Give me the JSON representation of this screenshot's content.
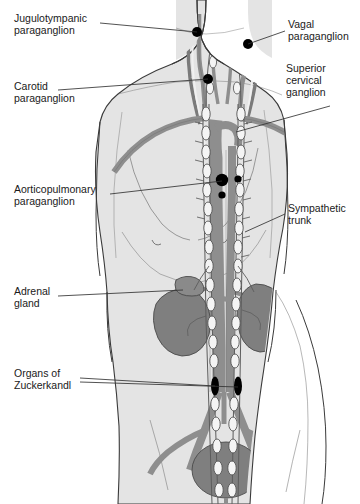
{
  "figure": {
    "background_color": "#ffffff"
  },
  "palette": {
    "body_fill": "#e4e4e4",
    "body_outline": "#3a3a3a",
    "skin_shadow": "#d2d2d2",
    "vessel_fill": "#8e8e8e",
    "vessel_outline": "#4a4a4a",
    "nerve_fill": "#f2f2f2",
    "nerve_outline": "#555555",
    "organ_fill": "#7f7f7f",
    "organ_outline": "#4a4a4a",
    "paraganglion_fill": "#000000",
    "leader_line": "#333333",
    "text": "#1a1a1a"
  },
  "labels": [
    {
      "id": "jugulotympanic-paraganglion",
      "lines": [
        "Jugulotympanic",
        "paraganglion"
      ],
      "text": "Jugulotympanic paraganglion",
      "x": 14,
      "y": 18,
      "align": "left",
      "leader": {
        "x1": 100,
        "y1": 23,
        "x2": 197,
        "y2": 32
      }
    },
    {
      "id": "carotid-paraganglion",
      "lines": [
        "Carotid",
        "paraganglion"
      ],
      "text": "Carotid paraganglion",
      "x": 14,
      "y": 86,
      "align": "left",
      "leader": {
        "x1": 58,
        "y1": 90,
        "x2": 208,
        "y2": 79
      }
    },
    {
      "id": "aorticopulmonary-paraganglion",
      "lines": [
        "Aorticopulmonary",
        "paraganglion"
      ],
      "text": "Aorticopulmonary paraganglion",
      "x": 14,
      "y": 189,
      "align": "left",
      "leader": {
        "x1": 110,
        "y1": 194,
        "x2": 222,
        "y2": 181
      }
    },
    {
      "id": "adrenal-gland",
      "lines": [
        "Adrenal",
        "gland"
      ],
      "text": "Adrenal gland",
      "x": 14,
      "y": 291,
      "align": "left",
      "leader": {
        "x1": 58,
        "y1": 296,
        "x2": 183,
        "y2": 290
      }
    },
    {
      "id": "organs-of-zuckerkandl",
      "lines": [
        "Organs of",
        "Zuckerkandl"
      ],
      "text": "Organs of Zuckerkandl",
      "x": 14,
      "y": 373,
      "align": "left",
      "leader": {
        "x1": 80,
        "y1": 378,
        "x2": 215,
        "y2": 386
      },
      "leader2": {
        "x1": 80,
        "y1": 382,
        "x2": 238,
        "y2": 386
      }
    },
    {
      "id": "vagal-paraganglion",
      "lines": [
        "Vagal",
        "paraganglion"
      ],
      "text": "Vagal paraganglion",
      "x": 288,
      "y": 24,
      "align": "left",
      "leader": {
        "x1": 285,
        "y1": 31,
        "x2": 248,
        "y2": 44
      }
    },
    {
      "id": "superior-cervical-ganglion",
      "lines": [
        "Superior",
        "cervical",
        "ganglion"
      ],
      "text": "Superior cervical ganglion",
      "x": 286,
      "y": 68,
      "align": "left",
      "leader": {
        "x1": 330,
        "y1": 106,
        "x2": 236,
        "y2": 132
      }
    },
    {
      "id": "sympathetic-trunk",
      "lines": [
        "Sympathetic",
        "trunk"
      ],
      "text": "Sympathetic trunk",
      "x": 288,
      "y": 208,
      "align": "left",
      "leader": {
        "x1": 285,
        "y1": 214,
        "x2": 245,
        "y2": 232
      }
    }
  ],
  "paraganglia_markers": [
    {
      "id": "jugulotympanic-marker",
      "cx": 197,
      "cy": 32,
      "r": 5.0
    },
    {
      "id": "vagal-marker",
      "cx": 248,
      "cy": 44,
      "r": 5.0
    },
    {
      "id": "carotid-marker",
      "cx": 208,
      "cy": 79,
      "r": 5.0
    },
    {
      "id": "aorticopulmonary-marker-large",
      "cx": 222,
      "cy": 180,
      "r": 6.2
    },
    {
      "id": "aorticopulmonary-marker-right",
      "cx": 238,
      "cy": 179,
      "r": 3.6
    },
    {
      "id": "aorticopulmonary-marker-lower",
      "cx": 222,
      "cy": 195,
      "r": 3.6
    }
  ],
  "zuckerkandl_bodies": [
    {
      "id": "zuckerkandl-left",
      "cx": 215,
      "cy": 386,
      "rx": 4.0,
      "ry": 9.5
    },
    {
      "id": "zuckerkandl-right",
      "cx": 238,
      "cy": 386,
      "rx": 4.0,
      "ry": 9.5
    }
  ],
  "organs": [
    {
      "id": "left-kidney",
      "label": "kidney",
      "cx": 186,
      "cy": 312
    },
    {
      "id": "right-kidney",
      "label": "kidney",
      "cx": 268,
      "cy": 305
    },
    {
      "id": "adrenal-gland-organ",
      "label": "adrenal gland",
      "cx": 187,
      "cy": 289
    },
    {
      "id": "bladder",
      "label": "urinary bladder",
      "cx": 226,
      "cy": 470
    }
  ],
  "structures": [
    {
      "id": "sympathetic-trunk-left",
      "label": "sympathetic trunk (left chain)"
    },
    {
      "id": "sympathetic-trunk-right",
      "label": "sympathetic trunk (right chain)"
    },
    {
      "id": "aorta",
      "label": "aorta"
    },
    {
      "id": "subclavian-vessels",
      "label": "subclavian vessels"
    },
    {
      "id": "carotid-vessels",
      "label": "carotid vessels"
    },
    {
      "id": "iliac-vessels",
      "label": "common iliac vessels"
    }
  ]
}
